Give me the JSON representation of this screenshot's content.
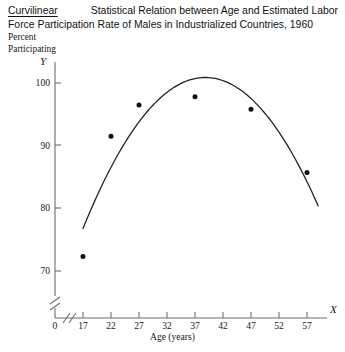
{
  "title": {
    "emphasis_word": "Curvilinear",
    "line1_rest": "Statistical Relation between Age and Estimated Labor",
    "line2": "Force Participation Rate of Males in Industrialized Countries, 1960",
    "full": "Curvilinear Statistical Relation between Age and Estimated Labor Force Participation Rate of Males in Industrialized Countries, 1960"
  },
  "axes": {
    "y_caption_line1": "Percent",
    "y_caption_line2": "Participating",
    "y_symbol": "Y",
    "x_symbol": "X",
    "x_title": "Age (years)"
  },
  "chart_data": {
    "type": "scatter",
    "xlabel": "Age (years)",
    "ylabel": "Percent Participating",
    "x": [
      17,
      22,
      27,
      37,
      47,
      57
    ],
    "values": [
      72.3,
      91.5,
      96.5,
      97.8,
      95.8,
      85.7
    ],
    "point_labels": [
      "17",
      "22",
      "27",
      "37",
      "47",
      "57"
    ],
    "xlim": [
      14.5,
      60
    ],
    "ylim": [
      66,
      102
    ],
    "xticks": [
      0,
      17,
      22,
      27,
      32,
      37,
      42,
      47,
      52,
      57
    ],
    "xtick_labels": [
      "0",
      "17",
      "22",
      "27",
      "32",
      "37",
      "42",
      "47",
      "52",
      "57"
    ],
    "yticks": [
      70,
      80,
      90,
      100
    ],
    "ytick_labels": [
      "70",
      "80",
      "90",
      "100"
    ],
    "grid": false,
    "legend": "none",
    "axis_break_x": true,
    "axis_break_y": true,
    "fit_curve": {
      "present": true,
      "shape": "concave-down quadratic",
      "description": "smooth curve rising steeply from age 17, peaking near age 36-38, then declining through age 57"
    },
    "colors": {
      "point": "#111111",
      "curve": "#222222",
      "axis": "#6e6e6e",
      "background": "#ffffff"
    }
  }
}
